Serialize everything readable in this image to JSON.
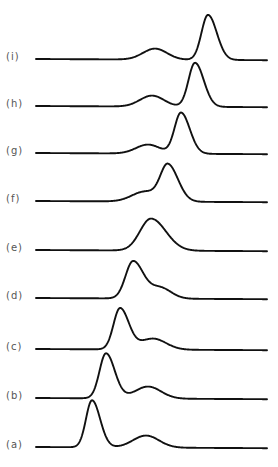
{
  "chart_data": {
    "type": "line",
    "title": "",
    "xlabel": "",
    "ylabel": "",
    "grid": false,
    "legend": "none",
    "layout": "stacked offset traces, labeled on left, (a) at bottom to (i) at top",
    "x_range_px": [
      36,
      267
    ],
    "series": [
      {
        "name": "(a)",
        "label": "(a)",
        "baseline_y": 447,
        "main_peak": {
          "x": 92,
          "height": 47,
          "width": 6
        },
        "second_peak": {
          "x": 146,
          "height": 12,
          "width": 13
        }
      },
      {
        "name": "(b)",
        "label": "(b)",
        "baseline_y": 398,
        "main_peak": {
          "x": 106,
          "height": 45,
          "width": 6.5
        },
        "second_peak": {
          "x": 148,
          "height": 12,
          "width": 13
        }
      },
      {
        "name": "(c)",
        "label": "(c)",
        "baseline_y": 349,
        "main_peak": {
          "x": 120,
          "height": 41,
          "width": 6.5
        },
        "second_peak": {
          "x": 153,
          "height": 11,
          "width": 13
        }
      },
      {
        "name": "(d)",
        "label": "(d)",
        "baseline_y": 298,
        "main_peak": {
          "x": 133,
          "height": 37,
          "width": 7.5
        },
        "second_peak": {
          "x": 160,
          "height": 11,
          "width": 11
        }
      },
      {
        "name": "(e)",
        "label": "(e)",
        "baseline_y": 250,
        "main_peak": {
          "x": 151,
          "height": 32,
          "width": 11
        },
        "second_peak": {
          "x": 151,
          "height": 0,
          "width": 10
        }
      },
      {
        "name": "(f)",
        "label": "(f)",
        "baseline_y": 201,
        "main_peak": {
          "x": 168,
          "height": 36,
          "width": 7.5
        },
        "second_peak": {
          "x": 145,
          "height": 10,
          "width": 13
        }
      },
      {
        "name": "(g)",
        "label": "(g)",
        "baseline_y": 153,
        "main_peak": {
          "x": 181,
          "height": 41,
          "width": 6.5
        },
        "second_peak": {
          "x": 148,
          "height": 9,
          "width": 12
        }
      },
      {
        "name": "(h)",
        "label": "(h)",
        "baseline_y": 106,
        "main_peak": {
          "x": 195,
          "height": 44,
          "width": 6.5
        },
        "second_peak": {
          "x": 152,
          "height": 11,
          "width": 12
        }
      },
      {
        "name": "(i)",
        "label": "(i)",
        "baseline_y": 59,
        "main_peak": {
          "x": 208,
          "height": 45,
          "width": 6.5
        },
        "second_peak": {
          "x": 155,
          "height": 11,
          "width": 12
        }
      }
    ]
  },
  "labels": [
    "(a)",
    "(b)",
    "(c)",
    "(d)",
    "(e)",
    "(f)",
    "(g)",
    "(h)",
    "(i)"
  ]
}
